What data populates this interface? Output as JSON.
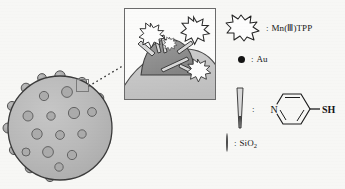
{
  "figure": {
    "background_color": "#f7f7f5",
    "ink_color": "#161616"
  },
  "main_particle": {
    "name": "silica-nanoparticle-with-gold",
    "body_color": "#b9b9b9",
    "outline_color": "#3a3a3a",
    "surface_dot_color": "#a8a8a8",
    "interior_dot_color": "#ababab",
    "surface_bumps": 18,
    "interior_dots": 13
  },
  "callout": {
    "highlight_box_label": "surface-region-highlight",
    "connector_style": "dotted",
    "connector_color": "#3a3a3a"
  },
  "inset": {
    "name": "surface-detail-inset",
    "border_color": "#6b6b6b",
    "background_color": "#fbfbfa",
    "gold_particle_color": "#8f8f8f",
    "silica_surface_color": "#c3c3c3",
    "burst_count": 4,
    "linker_count": 4
  },
  "legend": {
    "items": [
      {
        "key": "mn-tpp",
        "icon": "starburst-icon",
        "colon": ":",
        "label": "Mn(Ⅲ)TPP"
      },
      {
        "key": "au",
        "icon": "filled-circle-icon",
        "colon": ":",
        "label": "Au"
      },
      {
        "key": "pyridine-thiol",
        "icon": "needle-icon",
        "colon": ":",
        "label": "",
        "structure": {
          "ring": "pyridine",
          "hetero_atom": "N",
          "substituent": "SH"
        }
      },
      {
        "key": "sio2",
        "icon": "shaded-sphere-icon",
        "colon": ":",
        "label_html": "SiO2",
        "label_main": "SiO",
        "label_sub": "2"
      }
    ]
  }
}
